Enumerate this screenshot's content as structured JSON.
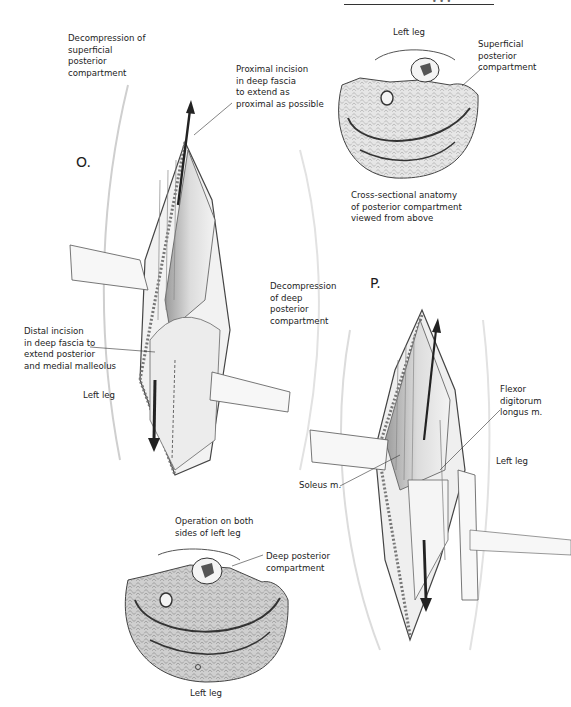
{
  "page": {
    "header": {
      "page_mark": "• • •"
    }
  },
  "panel_o": {
    "letter": "O.",
    "labels": {
      "title": "Decompression of\nsuperficial\nposterior\ncompartment",
      "proximal": "Proximal incision\nin deep fascia\nto extend as\nproximal as possible",
      "distal": "Distal incision\nin deep fascia to\nextend posterior\nand medial malleolus",
      "leg": "Left leg"
    }
  },
  "cross_section_top": {
    "title": "Left leg",
    "compartment_label": "Superficial\nposterior\ncompartment",
    "caption": "Cross-sectional anatomy\nof posterior compartment\nviewed from above"
  },
  "panel_p": {
    "letter": "P.",
    "labels": {
      "title": "Decompression\nof deep\nposterior\ncompartment",
      "flexor": "Flexor\ndigitorum\nlongus m.",
      "soleus": "Soleus m.",
      "leg": "Left leg"
    }
  },
  "cross_section_bottom": {
    "title": "Operation on both\nsides of left leg",
    "compartment_label": "Deep posterior\ncompartment",
    "caption": "Left leg"
  },
  "colors": {
    "ink": "#1c1c1c",
    "shade": "#bdbdbd",
    "muscle": "#d6d6d6",
    "bone_marrow": "#555555"
  }
}
